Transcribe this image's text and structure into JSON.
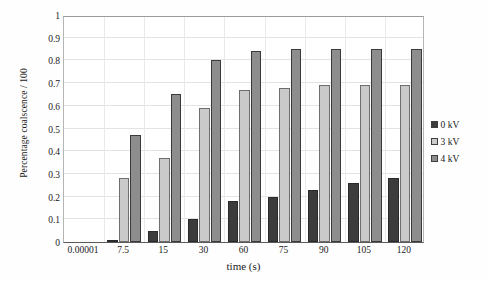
{
  "chart_data": {
    "type": "bar",
    "title": "",
    "subtitle": "",
    "xlabel": "time (s)",
    "ylabel": "Percentage coalscence / 100",
    "categories": [
      "0.00001",
      "7.5",
      "15",
      "30",
      "60",
      "75",
      "90",
      "105",
      "120"
    ],
    "series": [
      {
        "name": "0 kV",
        "color": "#3c3c3c",
        "values": [
          0,
          0.01,
          0.05,
          0.1,
          0.18,
          0.2,
          0.23,
          0.26,
          0.28
        ]
      },
      {
        "name": "3 kV",
        "color": "#cacaca",
        "values": [
          0,
          0.28,
          0.37,
          0.59,
          0.67,
          0.68,
          0.69,
          0.69,
          0.69
        ]
      },
      {
        "name": "4 kV",
        "color": "#8d8d8d",
        "values": [
          0,
          0.47,
          0.65,
          0.8,
          0.84,
          0.85,
          0.85,
          0.85,
          0.85
        ]
      }
    ],
    "ylim": [
      0,
      1
    ],
    "ytick_labels": [
      "0",
      "0.1",
      "0.2",
      "0.3",
      "0.4",
      "0.5",
      "0.6",
      "0.7",
      "0.8",
      "0.9",
      "1"
    ],
    "ytick_values": [
      0,
      0.1,
      0.2,
      0.3,
      0.4,
      0.5,
      0.6,
      0.7,
      0.8,
      0.9,
      1
    ],
    "grid": "horizontal-and-vertical",
    "legend_position": "right",
    "legend_entries": [
      "0 kV",
      "3 kV",
      "4 kV"
    ]
  }
}
